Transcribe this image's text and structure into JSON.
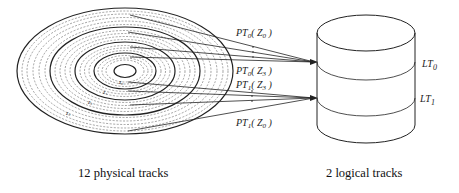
{
  "diagram": {
    "left_caption": "12 physical tracks",
    "right_caption": "2 logical tracks",
    "disk": {
      "zones": [
        {
          "label": "z0"
        },
        {
          "label": "z1"
        },
        {
          "label": "z2"
        },
        {
          "label": "z3"
        }
      ],
      "physical_track_count": 12
    },
    "mappings": [
      {
        "label_top": "PT0(Z0)",
        "label_top_main": "PT",
        "label_top_sub": "0",
        "label_top_arg": "( Z",
        "label_top_arg_sub": "0",
        "label_top_close": " )",
        "label_bottom": "PT0(Z3)",
        "label_bottom_main": "PT",
        "label_bottom_sub": "0",
        "label_bottom_arg": "( Z",
        "label_bottom_arg_sub": "3",
        "label_bottom_close": " )",
        "target": "LT0"
      },
      {
        "label_top": "PT1(Z3)",
        "label_top_main": "PT",
        "label_top_sub": "1",
        "label_top_arg": "( Z",
        "label_top_arg_sub": "3",
        "label_top_close": " )",
        "label_bottom": "PT1(Z0)",
        "label_bottom_main": "PT",
        "label_bottom_sub": "1",
        "label_bottom_arg": "( Z",
        "label_bottom_arg_sub": "0",
        "label_bottom_close": " )",
        "target": "LT1"
      }
    ],
    "logical_tracks": [
      {
        "main": "LT",
        "sub": "0"
      },
      {
        "main": "LT",
        "sub": "1"
      }
    ],
    "colors": {
      "stroke": "#222222",
      "dashed": "#555555",
      "background": "#ffffff"
    }
  }
}
